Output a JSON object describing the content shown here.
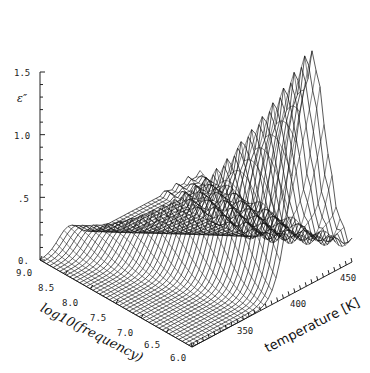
{
  "chart_data": {
    "type": "surface3d",
    "title": "",
    "zlabel": "ε″",
    "xlabel": "log10(frequency)",
    "ylabel": "temperature [K]",
    "z_ticks": [
      "0.",
      ".5",
      "1.0",
      "1.5"
    ],
    "zlim": [
      0,
      1.5
    ],
    "x_ticks": [
      "9.0",
      "8.5",
      "8.0",
      "7.5",
      "7.0",
      "6.5",
      "6.0"
    ],
    "xlim": [
      9.0,
      6.0
    ],
    "y_ticks": [
      "350",
      "400",
      "450"
    ],
    "ylim": [
      320,
      460
    ],
    "peak": {
      "log10_frequency": 6.3,
      "temperature_K": 400,
      "epsilon_dp": 1.65
    },
    "grid": false,
    "legend": null
  },
  "axes": {
    "z_label": "ε″",
    "x_title": "log10(frequency)",
    "y_title": "temperature [K]"
  }
}
